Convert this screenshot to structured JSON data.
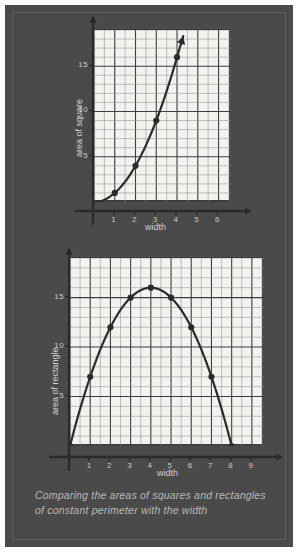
{
  "figure": {
    "caption": "Comparing the areas of squares and rectangles of constant perimeter with the width",
    "background_color": "#4a4a4a",
    "grid_color": "#f2f2ee",
    "ink_color": "#2b2b2b",
    "label_color": "#c9c9c9"
  },
  "chart_data": [
    {
      "type": "line",
      "id": "area-of-square",
      "title": "",
      "xlabel": "width",
      "ylabel": "area of square",
      "x": [
        0,
        1,
        2,
        3,
        4
      ],
      "values": [
        0,
        1,
        4,
        9,
        16
      ],
      "markers_x": [
        1,
        2,
        3,
        4
      ],
      "markers_y": [
        1,
        4,
        9,
        16
      ],
      "xticks": [
        1,
        2,
        3,
        4,
        5,
        6
      ],
      "xtick_labels": [
        "1",
        "2",
        "3",
        "4",
        "5",
        "6"
      ],
      "yticks": [
        5,
        10,
        15
      ],
      "ytick_labels": [
        "5",
        "10",
        "15"
      ],
      "xlim": [
        0,
        6.6
      ],
      "ylim": [
        0,
        19
      ],
      "grid": true,
      "arrow_x_axis": true,
      "arrow_y_axis": true,
      "curve_arrow_end": true
    },
    {
      "type": "line",
      "id": "area-of-rectangle",
      "title": "",
      "xlabel": "width",
      "ylabel": "area of rectangle",
      "x": [
        0,
        1,
        2,
        3,
        4,
        5,
        6,
        7,
        8
      ],
      "values": [
        0,
        7,
        12,
        15,
        16,
        15,
        12,
        7,
        0
      ],
      "markers_x": [
        0,
        1,
        2,
        3,
        4,
        5,
        6,
        7,
        8
      ],
      "markers_y": [
        0,
        7,
        12,
        15,
        16,
        15,
        12,
        7,
        0
      ],
      "xticks": [
        1,
        2,
        3,
        4,
        5,
        6,
        7,
        8,
        9
      ],
      "xtick_labels": [
        "1",
        "2",
        "3",
        "4",
        "5",
        "6",
        "7",
        "8",
        "9"
      ],
      "yticks": [
        5,
        10,
        15
      ],
      "ytick_labels": [
        "5",
        "10",
        "15"
      ],
      "xlim": [
        0,
        9.6
      ],
      "ylim": [
        0,
        19
      ],
      "grid": true,
      "arrow_x_axis": true,
      "arrow_y_axis": true,
      "curve_arrow_end": false
    }
  ]
}
